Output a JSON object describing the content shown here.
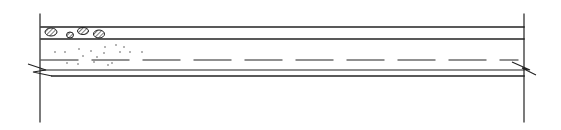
{
  "diagram": {
    "type": "section-detail",
    "stroke_color": "#222222",
    "background": "#ffffff",
    "walls": {
      "left_x": 40,
      "right_x": 524,
      "top_y": 14,
      "bottom_y": 122
    },
    "layers": [
      {
        "name": "top-line",
        "y": 27
      },
      {
        "name": "aggregate-bottom-line",
        "y": 39
      },
      {
        "name": "dashed-line",
        "y": 60,
        "dash": 37,
        "gap": 14
      },
      {
        "name": "slab-top-line",
        "y": 70
      },
      {
        "name": "slab-bottom-line",
        "y": 76
      }
    ],
    "break_symbols": [
      "left",
      "right"
    ]
  }
}
